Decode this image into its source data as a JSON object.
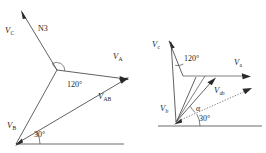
{
  "figure": {
    "background_color": "#ffffff",
    "line_color": "#3a3a3a",
    "text_color": "#1d1d1d",
    "width": 266,
    "height": 153
  },
  "left_diagram": {
    "name": "phasor-diagram-uppercase",
    "labels": {
      "vc": {
        "symbol": "V",
        "subscript": "C"
      },
      "va": {
        "symbol": "V",
        "subscript": "A"
      },
      "vb": {
        "symbol": "V",
        "subscript": "B"
      },
      "vab": {
        "symbol": "V",
        "subscript": "AB"
      },
      "node": "N3",
      "angle_120": "120°",
      "angle_30": "30°"
    }
  },
  "right_diagram": {
    "name": "phasor-diagram-lowercase",
    "labels": {
      "vc": {
        "symbol": "V",
        "subscript": "c"
      },
      "va": {
        "symbol": "V",
        "subscript": "a"
      },
      "vb": {
        "symbol": "V",
        "subscript": "b"
      },
      "vab": {
        "symbol": "V",
        "subscript": "ab"
      },
      "angle_120": "120°",
      "angle_30": "30°",
      "angle_alpha": "α"
    }
  }
}
